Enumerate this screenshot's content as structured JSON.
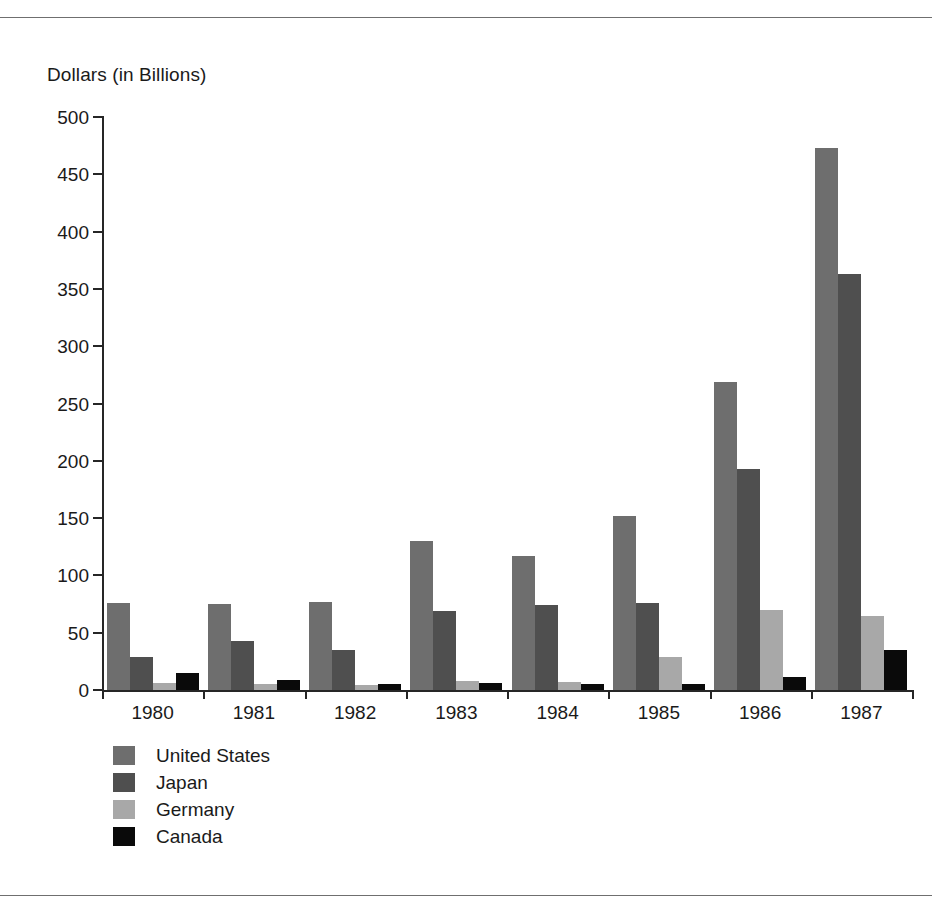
{
  "chart_data": {
    "type": "bar",
    "title": "",
    "subtitle": "",
    "xlabel": "",
    "ylabel": "Dollars (in Billions)",
    "categories": [
      "1980",
      "1981",
      "1982",
      "1983",
      "1984",
      "1985",
      "1986",
      "1987"
    ],
    "series": [
      {
        "name": "United States",
        "color": "#6e6e6e",
        "values": [
          76,
          75,
          77,
          130,
          117,
          152,
          269,
          473
        ]
      },
      {
        "name": "Japan",
        "color": "#4f4f4f",
        "values": [
          29,
          43,
          35,
          69,
          74,
          76,
          193,
          363
        ]
      },
      {
        "name": "Germany",
        "color": "#a8a8a8",
        "values": [
          6,
          5,
          4,
          8,
          7,
          29,
          70,
          65
        ]
      },
      {
        "name": "Canada",
        "color": "#0a0a0a",
        "values": [
          15,
          9,
          5,
          6,
          5,
          5,
          11,
          35
        ]
      }
    ],
    "ylim": [
      0,
      500
    ],
    "ytick_labels": [
      "500",
      "450",
      "400",
      "350",
      "300",
      "250",
      "200",
      "150",
      "100",
      "50",
      "0"
    ],
    "ytick_values": [
      500,
      450,
      400,
      350,
      300,
      250,
      200,
      150,
      100,
      50,
      0
    ],
    "ytick_step": 50,
    "grid": false,
    "legend_position": "bottom-left",
    "legend": [
      "United States",
      "Japan",
      "Germany",
      "Canada"
    ]
  },
  "figure": {
    "axis_title": "Dollars (in Billions)",
    "top_rule": "horizontal-rule",
    "bottom_rule": "horizontal-rule"
  }
}
